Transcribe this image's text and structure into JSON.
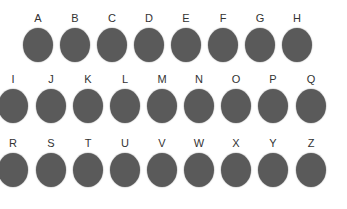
{
  "colors": {
    "circle": "#5a5a5a",
    "label": "#333333",
    "background": "#ffffff"
  },
  "rows": [
    {
      "top": 12,
      "items": [
        {
          "label": "A",
          "x": 38
        },
        {
          "label": "B",
          "x": 75
        },
        {
          "label": "C",
          "x": 112
        },
        {
          "label": "D",
          "x": 149
        },
        {
          "label": "E",
          "x": 186
        },
        {
          "label": "F",
          "x": 223
        },
        {
          "label": "G",
          "x": 260
        },
        {
          "label": "H",
          "x": 297
        }
      ]
    },
    {
      "top": 73,
      "items": [
        {
          "label": "I",
          "x": 13
        },
        {
          "label": "J",
          "x": 51
        },
        {
          "label": "K",
          "x": 88
        },
        {
          "label": "L",
          "x": 125
        },
        {
          "label": "M",
          "x": 162
        },
        {
          "label": "N",
          "x": 199
        },
        {
          "label": "O",
          "x": 236
        },
        {
          "label": "P",
          "x": 273
        },
        {
          "label": "Q",
          "x": 311
        }
      ]
    },
    {
      "top": 137,
      "items": [
        {
          "label": "R",
          "x": 13
        },
        {
          "label": "S",
          "x": 51
        },
        {
          "label": "T",
          "x": 88
        },
        {
          "label": "U",
          "x": 125
        },
        {
          "label": "V",
          "x": 162
        },
        {
          "label": "W",
          "x": 199
        },
        {
          "label": "X",
          "x": 236
        },
        {
          "label": "Y",
          "x": 273
        },
        {
          "label": "Z",
          "x": 311
        }
      ]
    }
  ]
}
